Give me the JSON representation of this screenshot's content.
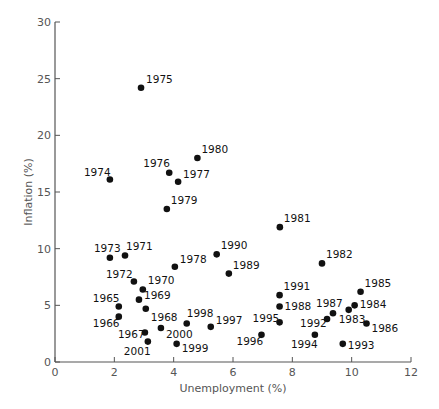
{
  "chart_data": {
    "type": "scatter",
    "title": "",
    "xlabel": "Unemployment (%)",
    "ylabel": "Inflation (%)",
    "xlim": [
      0,
      12
    ],
    "ylim": [
      0,
      30
    ],
    "xticks": [
      0,
      2,
      4,
      6,
      8,
      10,
      12
    ],
    "yticks": [
      0,
      5,
      10,
      15,
      20,
      25,
      30
    ],
    "grid": false,
    "legend": null,
    "point_color": "#111111",
    "points": [
      {
        "label": "1965",
        "x": 2.15,
        "y": 4.9,
        "lx": -26,
        "ly": -4
      },
      {
        "label": "1966",
        "x": 2.15,
        "y": 4.0,
        "lx": -26,
        "ly": 10
      },
      {
        "label": "1967",
        "x": 3.03,
        "y": 2.6,
        "lx": -27,
        "ly": 5
      },
      {
        "label": "1968",
        "x": 3.06,
        "y": 4.7,
        "lx": 5,
        "ly": 12
      },
      {
        "label": "1969",
        "x": 2.83,
        "y": 5.5,
        "lx": 5,
        "ly": -1
      },
      {
        "label": "1970",
        "x": 2.96,
        "y": 6.4,
        "lx": 5,
        "ly": -5
      },
      {
        "label": "1971",
        "x": 2.36,
        "y": 9.4,
        "lx": 1,
        "ly": -5
      },
      {
        "label": "1972",
        "x": 2.66,
        "y": 7.1,
        "lx": -28,
        "ly": -4
      },
      {
        "label": "1973",
        "x": 1.85,
        "y": 9.2,
        "lx": -16,
        "ly": -6
      },
      {
        "label": "1974",
        "x": 1.85,
        "y": 16.1,
        "lx": -26,
        "ly": -4
      },
      {
        "label": "1975",
        "x": 2.9,
        "y": 24.2,
        "lx": 5,
        "ly": -5
      },
      {
        "label": "1976",
        "x": 3.85,
        "y": 16.7,
        "lx": -26,
        "ly": -6
      },
      {
        "label": "1977",
        "x": 4.15,
        "y": 15.9,
        "lx": 5,
        "ly": -4
      },
      {
        "label": "1978",
        "x": 4.04,
        "y": 8.4,
        "lx": 5,
        "ly": -4
      },
      {
        "label": "1979",
        "x": 3.77,
        "y": 13.5,
        "lx": 4,
        "ly": -5
      },
      {
        "label": "1980",
        "x": 4.8,
        "y": 18.0,
        "lx": 4,
        "ly": -5
      },
      {
        "label": "1981",
        "x": 7.58,
        "y": 11.9,
        "lx": 4,
        "ly": -5
      },
      {
        "label": "1982",
        "x": 9.0,
        "y": 8.7,
        "lx": 4,
        "ly": -5
      },
      {
        "label": "1983",
        "x": 9.9,
        "y": 4.6,
        "lx": -10,
        "ly": 13
      },
      {
        "label": "1984",
        "x": 10.1,
        "y": 5.0,
        "lx": 5,
        "ly": 3
      },
      {
        "label": "1985",
        "x": 10.3,
        "y": 6.2,
        "lx": 4,
        "ly": -5
      },
      {
        "label": "1986",
        "x": 10.5,
        "y": 3.4,
        "lx": 5,
        "ly": 9
      },
      {
        "label": "1987",
        "x": 9.37,
        "y": 4.3,
        "lx": -17,
        "ly": -6
      },
      {
        "label": "1988",
        "x": 7.57,
        "y": 4.9,
        "lx": 5,
        "ly": 4
      },
      {
        "label": "1989",
        "x": 5.86,
        "y": 7.8,
        "lx": 4,
        "ly": -5
      },
      {
        "label": "1990",
        "x": 5.45,
        "y": 9.5,
        "lx": 4,
        "ly": -5
      },
      {
        "label": "1991",
        "x": 7.57,
        "y": 5.9,
        "lx": 4,
        "ly": -5
      },
      {
        "label": "1992",
        "x": 9.17,
        "y": 3.8,
        "lx": -27,
        "ly": 8
      },
      {
        "label": "1993",
        "x": 9.7,
        "y": 1.6,
        "lx": 5,
        "ly": 5
      },
      {
        "label": "1994",
        "x": 8.76,
        "y": 2.4,
        "lx": -24,
        "ly": 13
      },
      {
        "label": "1995",
        "x": 7.57,
        "y": 3.5,
        "lx": -27,
        "ly": 0
      },
      {
        "label": "1996",
        "x": 6.96,
        "y": 2.4,
        "lx": -25,
        "ly": 10
      },
      {
        "label": "1997",
        "x": 5.25,
        "y": 3.1,
        "lx": 5,
        "ly": -3
      },
      {
        "label": "1998",
        "x": 4.44,
        "y": 3.4,
        "lx": 0,
        "ly": -6
      },
      {
        "label": "1999",
        "x": 4.1,
        "y": 1.6,
        "lx": 5,
        "ly": 8
      },
      {
        "label": "2000",
        "x": 3.57,
        "y": 3.0,
        "lx": 5,
        "ly": 10
      },
      {
        "label": "2001",
        "x": 3.13,
        "y": 1.8,
        "lx": -24,
        "ly": 13
      }
    ]
  },
  "layout": {
    "x0": 55,
    "x1": 411,
    "y0": 362,
    "y1": 22
  }
}
